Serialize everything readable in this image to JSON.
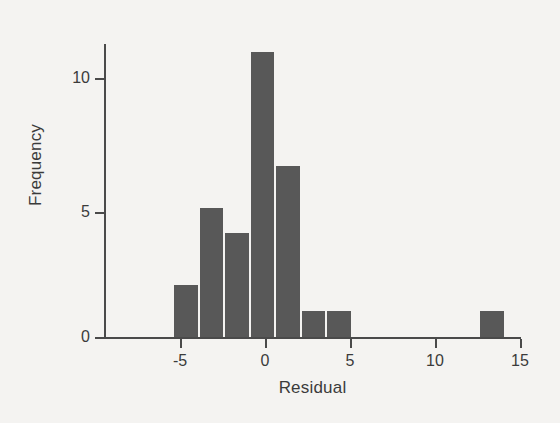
{
  "chart_data": {
    "type": "bar",
    "title": "",
    "subtitle": "",
    "xlabel": "Residual",
    "ylabel": "Frequency",
    "xlim": [
      -8.5,
      15.6
    ],
    "ylim": [
      0,
      11.8
    ],
    "xticks": [
      -5,
      0,
      5,
      10,
      15
    ],
    "xtick_labels": [
      "-5",
      "0",
      "5",
      "10",
      "15"
    ],
    "yticks": [
      0,
      5,
      10
    ],
    "ytick_labels": [
      "0",
      "5",
      "10"
    ],
    "grid": false,
    "legend": null,
    "bin_width": 1.5,
    "bars": [
      {
        "bin_start": -5.4,
        "bin_end": -3.9,
        "value": 2
      },
      {
        "bin_start": -3.9,
        "bin_end": -2.4,
        "value": 5
      },
      {
        "bin_start": -2.4,
        "bin_end": -0.9,
        "value": 4
      },
      {
        "bin_start": -0.9,
        "bin_end": 0.6,
        "value": 11
      },
      {
        "bin_start": 0.6,
        "bin_end": 2.1,
        "value": 6.6
      },
      {
        "bin_start": 2.1,
        "bin_end": 3.6,
        "value": 1
      },
      {
        "bin_start": 3.6,
        "bin_end": 5.1,
        "value": 1
      },
      {
        "bin_start": 12.6,
        "bin_end": 14.1,
        "value": 1
      }
    ],
    "categories": [
      "-5.4 to -3.9",
      "-3.9 to -2.4",
      "-2.4 to -0.9",
      "-0.9 to 0.6",
      "0.6 to 2.1",
      "2.1 to 3.6",
      "3.6 to 5.1",
      "12.6 to 14.1"
    ],
    "values": [
      2,
      5,
      4,
      11,
      6.6,
      1,
      1,
      1
    ],
    "colors": {
      "bar_fill": "#585858",
      "axis": "#4a4a4a",
      "text": "#3b3b3b",
      "background": "#f4f3f1"
    }
  }
}
